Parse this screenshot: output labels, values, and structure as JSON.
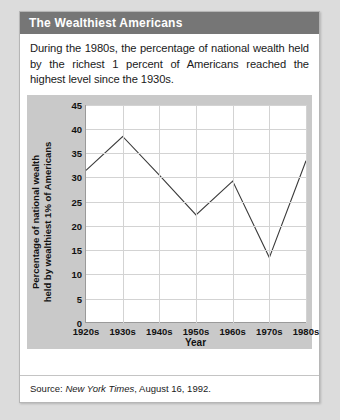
{
  "card": {
    "title": "The Wealthiest Americans",
    "caption": "During the 1980s, the percentage of national wealth held by the richest 1 percent of Americans reached the highest level since the 1930s.",
    "source_prefix": "Source:",
    "source_publication": "New York Times",
    "source_rest": ", August 16, 1992."
  },
  "colors": {
    "title_bar": "#767676",
    "title_text": "#ffffff",
    "card_background": "#ffffff",
    "page_background": "#dcdcdc",
    "chart_panel": "#c9c9c9",
    "plot_background": "#ffffff",
    "gridline": "#d3d3d3",
    "axis": "#9a9a9a",
    "series_line": "#3b3b3b"
  },
  "chart_data": {
    "type": "line",
    "title": "",
    "xlabel": "Year",
    "ylabel": "Percentage of national wealth held by wealthiest 1% of Americans",
    "ylabel_line1": "Percentage of national wealth",
    "ylabel_line2": "held by wealthiest 1% of Americans",
    "categories": [
      "1920s",
      "1930s",
      "1940s",
      "1950s",
      "1960s",
      "1970s",
      "1980s"
    ],
    "values": [
      31.5,
      38.5,
      30.5,
      22.3,
      29.3,
      13.5,
      33.5
    ],
    "yticks": [
      0,
      5,
      10,
      15,
      20,
      25,
      30,
      35,
      40,
      45
    ],
    "ylim": [
      0,
      45
    ],
    "grid": true,
    "legend": false
  }
}
